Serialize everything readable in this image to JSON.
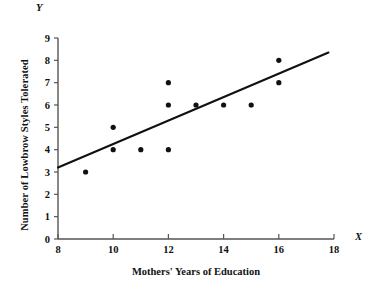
{
  "chart_data": {
    "type": "scatter",
    "title": "",
    "xlabel": "Mothers' Years of Education",
    "ylabel": "Number of Lowbrow Styles Tolerated",
    "x_axis_letter": "X",
    "y_axis_letter": "Y",
    "xlim": [
      8,
      18
    ],
    "ylim": [
      0,
      9
    ],
    "xticks": [
      8,
      10,
      12,
      14,
      16,
      18
    ],
    "xtick_labels": [
      "8",
      "10",
      "12",
      "14",
      "16",
      "18"
    ],
    "yticks": [
      0,
      1,
      2,
      3,
      4,
      5,
      6,
      7,
      8,
      9
    ],
    "ytick_labels": [
      "0",
      "1",
      "2",
      "3",
      "4",
      "5",
      "6",
      "7",
      "8",
      "9"
    ],
    "grid": false,
    "legend": null,
    "marker_color": "#111111",
    "line_color": "#111111",
    "axis_color": "#555555",
    "points": [
      {
        "x": 9,
        "y": 3
      },
      {
        "x": 10,
        "y": 5
      },
      {
        "x": 10,
        "y": 4
      },
      {
        "x": 11,
        "y": 4
      },
      {
        "x": 12,
        "y": 7
      },
      {
        "x": 12,
        "y": 6
      },
      {
        "x": 12,
        "y": 4
      },
      {
        "x": 13,
        "y": 6
      },
      {
        "x": 14,
        "y": 6
      },
      {
        "x": 15,
        "y": 6
      },
      {
        "x": 16,
        "y": 8
      },
      {
        "x": 16,
        "y": 7
      }
    ],
    "regression_line": {
      "x_start": 8,
      "y_start": 3.2,
      "x_end": 17.8,
      "y_end": 8.35
    }
  }
}
